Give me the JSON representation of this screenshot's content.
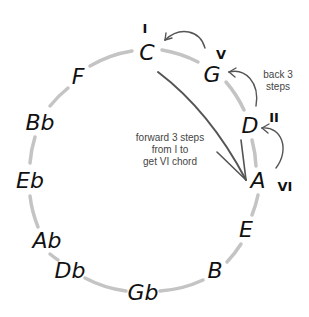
{
  "diagram": {
    "circle_color": "#c4c4c4",
    "arrow_color": "#555555",
    "text_color": "#111111",
    "caption_color": "#444444",
    "notes": [
      {
        "label": "C",
        "x": 147,
        "y": 52
      },
      {
        "label": "G",
        "x": 212,
        "y": 74
      },
      {
        "label": "D",
        "x": 250,
        "y": 125
      },
      {
        "label": "A",
        "x": 258,
        "y": 180
      },
      {
        "label": "E",
        "x": 246,
        "y": 229
      },
      {
        "label": "B",
        "x": 215,
        "y": 270
      },
      {
        "label": "Gb",
        "x": 143,
        "y": 292
      },
      {
        "label": "Db",
        "x": 70,
        "y": 270
      },
      {
        "label": "Ab",
        "x": 47,
        "y": 240
      },
      {
        "label": "Eb",
        "x": 30,
        "y": 180
      },
      {
        "label": "Bb",
        "x": 40,
        "y": 122
      },
      {
        "label": "F",
        "x": 78,
        "y": 76
      }
    ],
    "numerals": [
      {
        "label": "I",
        "x": 145,
        "y": 28
      },
      {
        "label": "V",
        "x": 221,
        "y": 54
      },
      {
        "label": "II",
        "x": 274,
        "y": 117
      },
      {
        "label": "VI",
        "x": 285,
        "y": 186
      }
    ],
    "captions": {
      "back": [
        "back 3",
        "steps"
      ],
      "forward": [
        "forward 3 steps",
        "from I to",
        "get VI chord"
      ]
    }
  }
}
